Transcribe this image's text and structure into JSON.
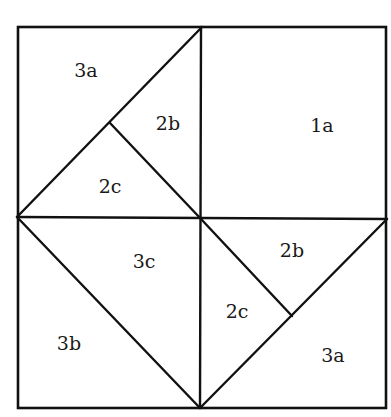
{
  "diagram": {
    "colors": {
      "line": "#111111",
      "background": "#ffffff",
      "text": "#1a1a1a"
    },
    "outer_square": {
      "x1": 18,
      "y1": 27,
      "x2": 386,
      "y2": 408
    },
    "lines": [
      {
        "name": "vertical-center-line",
        "x1": 201,
        "y1": 27,
        "x2": 200,
        "y2": 408
      },
      {
        "name": "horizontal-center-line",
        "x1": 17,
        "y1": 217,
        "x2": 387,
        "y2": 219
      },
      {
        "name": "top-left-diagonal",
        "x1": 17,
        "y1": 217,
        "x2": 202,
        "y2": 27
      },
      {
        "name": "top-left-inner-line",
        "x1": 110,
        "y1": 123,
        "x2": 201,
        "y2": 219
      },
      {
        "name": "bottom-left-diagonal",
        "x1": 17,
        "y1": 217,
        "x2": 200,
        "y2": 408
      },
      {
        "name": "bottom-right-diagonal",
        "x1": 200,
        "y1": 408,
        "x2": 387,
        "y2": 219
      },
      {
        "name": "bottom-right-inner-line",
        "x1": 201,
        "y1": 219,
        "x2": 292,
        "y2": 316
      }
    ],
    "labels": [
      {
        "id": "tl-3a",
        "text": "3a",
        "x": 86,
        "y": 72
      },
      {
        "id": "tl-2b",
        "text": "2b",
        "x": 168,
        "y": 125
      },
      {
        "id": "tl-2c",
        "text": "2c",
        "x": 110,
        "y": 188
      },
      {
        "id": "tr-1a",
        "text": "1a",
        "x": 322,
        "y": 127
      },
      {
        "id": "bl-3c",
        "text": "3c",
        "x": 144,
        "y": 263
      },
      {
        "id": "bl-3b",
        "text": "3b",
        "x": 69,
        "y": 345
      },
      {
        "id": "br-2b",
        "text": "2b",
        "x": 292,
        "y": 252
      },
      {
        "id": "br-2c",
        "text": "2c",
        "x": 237,
        "y": 313
      },
      {
        "id": "br-3a",
        "text": "3a",
        "x": 333,
        "y": 357
      }
    ]
  }
}
